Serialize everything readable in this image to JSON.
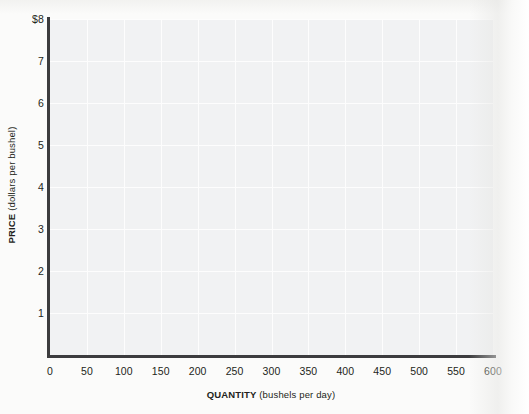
{
  "chart_data": {
    "type": "line",
    "title": "",
    "subtitle": "",
    "xlabel_bold": "QUANTITY",
    "xlabel_unit": "(bushels per day)",
    "ylabel_bold": "PRICE",
    "ylabel_unit": "(dollars per bushel)",
    "xlim": [
      0,
      600
    ],
    "ylim": [
      0,
      8
    ],
    "x_ticks": [
      0,
      50,
      100,
      150,
      200,
      250,
      300,
      350,
      400,
      450,
      500,
      550,
      600
    ],
    "x_tick_labels": [
      "0",
      "50",
      "100",
      "150",
      "200",
      "250",
      "300",
      "350",
      "400",
      "450",
      "500",
      "550",
      "600"
    ],
    "y_ticks": [
      1,
      2,
      3,
      4,
      5,
      6,
      7,
      8
    ],
    "y_tick_labels": [
      "1",
      "2",
      "3",
      "4",
      "5",
      "6",
      "7",
      "$8"
    ],
    "grid": true,
    "grid_color": "#fdfdfd",
    "plot_background": "#f1f2f3",
    "axis_color": "#3c3c3e",
    "legend": [],
    "legend_position": "none",
    "annotations": [],
    "series": [],
    "values": [],
    "categories": []
  },
  "axis_titles": {
    "y_bold": "PRICE",
    "y_unit": "(dollars per bushel)",
    "x_bold": "QUANTITY",
    "x_unit": "(bushels per day)"
  }
}
